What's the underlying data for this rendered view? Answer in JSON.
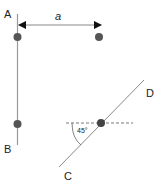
{
  "diagram": {
    "labels": {
      "a": "A",
      "b": "B",
      "c": "C",
      "d": "D",
      "dimension": "a",
      "angle": "45°"
    },
    "colors": {
      "line": "#999999",
      "dot": "#555555",
      "arrow": "#111111",
      "dashed": "#555555",
      "text": "#222222"
    }
  }
}
